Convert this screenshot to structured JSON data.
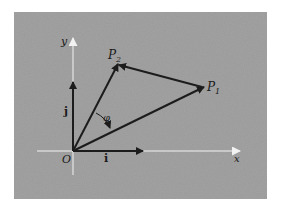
{
  "figure": {
    "background": "#ffffff",
    "panel_color": "#a3a3a3",
    "axis_color": "#f2f2f2",
    "vector_color": "#1c1c1c",
    "labels": {
      "x_axis": "x",
      "y_axis": "y",
      "origin": "O",
      "unit_i": "i",
      "unit_j": "j",
      "point_1": "P",
      "point_1_sub": "1",
      "point_2": "P",
      "point_2_sub": "2",
      "angle": "φ"
    }
  }
}
